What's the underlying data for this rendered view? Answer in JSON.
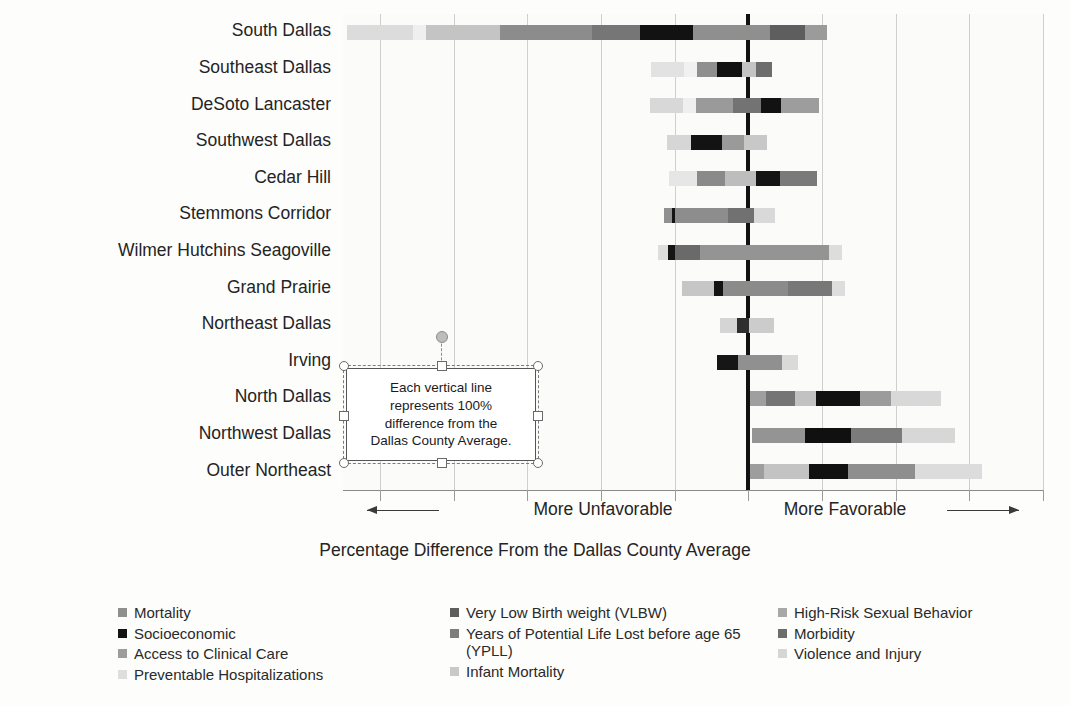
{
  "chart_data": {
    "type": "bar",
    "subtype": "diverging-stacked-horizontal",
    "title": "",
    "xlabel": "Percentage Difference From the Dallas County Average",
    "ylabel": "",
    "grid": true,
    "legend_position": "bottom",
    "axis": {
      "zero_label": "0",
      "gridline_step_percent": 100,
      "xlim": [
        -550,
        400
      ],
      "left_direction_label": "More Unfavorable",
      "right_direction_label": "More Favorable",
      "tick_positions": [
        -500,
        -400,
        -300,
        -200,
        -100,
        0,
        100,
        200,
        300,
        400
      ]
    },
    "categories": [
      "South Dallas",
      "Southeast Dallas",
      "DeSoto Lancaster",
      "Southwest Dallas",
      "Cedar Hill",
      "Stemmons Corridor",
      "Wilmer Hutchins Seagoville",
      "Grand Prairie",
      "Northeast Dallas",
      "Irving",
      "North Dallas",
      "Northwest Dallas",
      "Outer Northeast"
    ],
    "series": [
      {
        "name": "Mortality",
        "color": "#8f8f8f"
      },
      {
        "name": "Socioeconomic",
        "color": "#131313"
      },
      {
        "name": "Access to Clinical Care",
        "color": "#9d9d9d"
      },
      {
        "name": "Preventable Hospitalizations",
        "color": "#e0e0e0"
      },
      {
        "name": "Very Low Birth weight (VLBW)",
        "color": "#5e5e5e"
      },
      {
        "name": "Years of Potential Life Lost before age 65 (YPLL)",
        "color": "#7d7d7d"
      },
      {
        "name": "Infant Mortality",
        "color": "#c9c9c9"
      },
      {
        "name": "High-Risk Sexual Behavior",
        "color": "#a8a8a8"
      },
      {
        "name": "Morbidity",
        "color": "#6d6d6d"
      },
      {
        "name": "Violence and Injury",
        "color": "#d6d6d6"
      }
    ],
    "rows": [
      {
        "category": "South Dallas",
        "start_percent": -545,
        "segments": [
          {
            "name": "Preventable Hospitalizations",
            "width_percent": 90,
            "color": "#dcdcdc"
          },
          {
            "name": "Violence and Injury",
            "width_percent": 18,
            "color": "#efefef"
          },
          {
            "name": "Infant Mortality",
            "width_percent": 100,
            "color": "#c4c4c4"
          },
          {
            "name": "Years of Potential Life Lost before age 65 (YPLL)",
            "width_percent": 125,
            "color": "#8c8c8c"
          },
          {
            "name": "Morbidity",
            "width_percent": 65,
            "color": "#767676"
          },
          {
            "name": "Socioeconomic",
            "width_percent": 72,
            "color": "#121212"
          },
          {
            "name": "Mortality",
            "width_percent": 105,
            "color": "#8f8f8f"
          },
          {
            "name": "Very Low Birth weight (VLBW)",
            "width_percent": 47,
            "color": "#5e5e5e"
          },
          {
            "name": "Access to Clinical Care",
            "width_percent": 30,
            "color": "#9b9b9b"
          }
        ]
      },
      {
        "category": "Southeast Dallas",
        "start_percent": -132,
        "segments": [
          {
            "name": "Preventable Hospitalizations",
            "width_percent": 45,
            "color": "#e2e2e2"
          },
          {
            "name": "Violence and Injury",
            "width_percent": 17,
            "color": "#f1f1f1"
          },
          {
            "name": "Mortality",
            "width_percent": 27,
            "color": "#8f8f8f"
          },
          {
            "name": "Socioeconomic",
            "width_percent": 35,
            "color": "#121212"
          },
          {
            "name": "Infant Mortality",
            "width_percent": 18,
            "color": "#c4c4c4"
          },
          {
            "name": "Morbidity",
            "width_percent": 22,
            "color": "#6d6d6d"
          }
        ]
      },
      {
        "category": "DeSoto Lancaster",
        "start_percent": -133,
        "segments": [
          {
            "name": "Preventable Hospitalizations",
            "width_percent": 44,
            "color": "#d8d8d8"
          },
          {
            "name": "Violence and Injury",
            "width_percent": 18,
            "color": "#efefef"
          },
          {
            "name": "Years of Potential Life Lost before age 65 (YPLL)",
            "width_percent": 50,
            "color": "#9a9a9a"
          },
          {
            "name": "Morbidity",
            "width_percent": 38,
            "color": "#737373"
          },
          {
            "name": "Socioeconomic",
            "width_percent": 27,
            "color": "#121212"
          },
          {
            "name": "Access to Clinical Care",
            "width_percent": 52,
            "color": "#9d9d9d"
          }
        ]
      },
      {
        "category": "Southwest Dallas",
        "start_percent": -110,
        "segments": [
          {
            "name": "Preventable Hospitalizations",
            "width_percent": 32,
            "color": "#d6d6d6"
          },
          {
            "name": "Socioeconomic",
            "width_percent": 42,
            "color": "#131313"
          },
          {
            "name": "Mortality",
            "width_percent": 30,
            "color": "#9a9a9a"
          },
          {
            "name": "Infant Mortality",
            "width_percent": 32,
            "color": "#c8c8c8"
          }
        ]
      },
      {
        "category": "Cedar Hill",
        "start_percent": -108,
        "segments": [
          {
            "name": "Violence and Injury",
            "width_percent": 38,
            "color": "#e6e6e6"
          },
          {
            "name": "Years of Potential Life Lost before age 65 (YPLL)",
            "width_percent": 38,
            "color": "#8a8a8a"
          },
          {
            "name": "Infant Mortality",
            "width_percent": 42,
            "color": "#bdbdbd"
          },
          {
            "name": "Socioeconomic",
            "width_percent": 33,
            "color": "#141414"
          },
          {
            "name": "Morbidity",
            "width_percent": 50,
            "color": "#7a7a7a"
          }
        ]
      },
      {
        "category": "Stemmons Corridor",
        "start_percent": -114,
        "segments": [
          {
            "name": "Access to Clinical Care",
            "width_percent": 10,
            "color": "#909090"
          },
          {
            "name": "Socioeconomic",
            "width_percent": 5,
            "color": "#141414"
          },
          {
            "name": "Years of Potential Life Lost before age 65 (YPLL)",
            "width_percent": 72,
            "color": "#8d8d8d"
          },
          {
            "name": "Morbidity",
            "width_percent": 35,
            "color": "#717171"
          },
          {
            "name": "Preventable Hospitalizations",
            "width_percent": 28,
            "color": "#d9d9d9"
          }
        ]
      },
      {
        "category": "Wilmer Hutchins Seagoville",
        "start_percent": -122,
        "segments": [
          {
            "name": "Preventable Hospitalizations",
            "width_percent": 13,
            "color": "#dedede"
          },
          {
            "name": "Socioeconomic",
            "width_percent": 9,
            "color": "#151515"
          },
          {
            "name": "Morbidity",
            "width_percent": 34,
            "color": "#6a6a6a"
          },
          {
            "name": "Mortality",
            "width_percent": 175,
            "color": "#949494"
          },
          {
            "name": "Violence and Injury",
            "width_percent": 18,
            "color": "#dddddd"
          }
        ]
      },
      {
        "category": "Grand Prairie",
        "start_percent": -90,
        "segments": [
          {
            "name": "Infant Mortality",
            "width_percent": 44,
            "color": "#c6c6c6"
          },
          {
            "name": "Socioeconomic",
            "width_percent": 12,
            "color": "#131313"
          },
          {
            "name": "Years of Potential Life Lost before age 65 (YPLL)",
            "width_percent": 88,
            "color": "#8b8b8b"
          },
          {
            "name": "Morbidity",
            "width_percent": 60,
            "color": "#787878"
          },
          {
            "name": "Violence and Injury",
            "width_percent": 18,
            "color": "#dddddd"
          }
        ]
      },
      {
        "category": "Northeast Dallas",
        "start_percent": -38,
        "segments": [
          {
            "name": "Preventable Hospitalizations",
            "width_percent": 23,
            "color": "#d5d5d5"
          },
          {
            "name": "Socioeconomic",
            "width_percent": 16,
            "color": "#2e2e2e"
          },
          {
            "name": "Infant Mortality",
            "width_percent": 34,
            "color": "#cccccc"
          }
        ]
      },
      {
        "category": "Irving",
        "start_percent": -42,
        "segments": [
          {
            "name": "Socioeconomic",
            "width_percent": 28,
            "color": "#161616"
          },
          {
            "name": "Mortality",
            "width_percent": 60,
            "color": "#909090"
          },
          {
            "name": "Violence and Injury",
            "width_percent": 22,
            "color": "#dadada"
          }
        ]
      },
      {
        "category": "North Dallas",
        "start_percent": 2,
        "segments": [
          {
            "name": "Access to Clinical Care",
            "width_percent": 22,
            "color": "#9f9f9f"
          },
          {
            "name": "Morbidity",
            "width_percent": 40,
            "color": "#757575"
          },
          {
            "name": "Infant Mortality",
            "width_percent": 28,
            "color": "#c2c2c2"
          },
          {
            "name": "Socioeconomic",
            "width_percent": 60,
            "color": "#111111"
          },
          {
            "name": "Mortality",
            "width_percent": 42,
            "color": "#9b9b9b"
          },
          {
            "name": "Preventable Hospitalizations",
            "width_percent": 68,
            "color": "#d8d8d8"
          }
        ]
      },
      {
        "category": "Northwest Dallas",
        "start_percent": 5,
        "segments": [
          {
            "name": "Mortality",
            "width_percent": 72,
            "color": "#949494"
          },
          {
            "name": "Socioeconomic",
            "width_percent": 62,
            "color": "#101010"
          },
          {
            "name": "Morbidity",
            "width_percent": 70,
            "color": "#7b7b7b"
          },
          {
            "name": "Violence and Injury",
            "width_percent": 72,
            "color": "#d7d7d7"
          }
        ]
      },
      {
        "category": "Outer Northeast",
        "start_percent": 3,
        "segments": [
          {
            "name": "Access to Clinical Care",
            "width_percent": 18,
            "color": "#9d9d9d"
          },
          {
            "name": "Infant Mortality",
            "width_percent": 62,
            "color": "#c3c3c3"
          },
          {
            "name": "Socioeconomic",
            "width_percent": 52,
            "color": "#111111"
          },
          {
            "name": "Years of Potential Life Lost before age 65 (YPLL)",
            "width_percent": 92,
            "color": "#8e8e8e"
          },
          {
            "name": "Violence and Injury",
            "width_percent": 90,
            "color": "#dcdcdc"
          }
        ]
      }
    ],
    "annotation": {
      "text": "Each vertical line represents 100% difference from the Dallas County Average.",
      "line1": "Each vertical line",
      "line2": "represents 100%",
      "line3": "difference from the",
      "line4": "Dallas County Average."
    }
  },
  "legend": {
    "columns": [
      [
        {
          "label": "Mortality",
          "color": "#8f8f8f"
        },
        {
          "label": "Socioeconomic",
          "color": "#131313"
        },
        {
          "label": "Access to Clinical Care",
          "color": "#9d9d9d"
        },
        {
          "label": "Preventable Hospitalizations",
          "color": "#dedede"
        }
      ],
      [
        {
          "label": "Very Low Birth weight (VLBW)",
          "color": "#5e5e5e"
        },
        {
          "label": "Years of Potential Life Lost before age 65 (YPLL)",
          "color": "#7d7d7d"
        },
        {
          "label": "Infant Mortality",
          "color": "#c9c9c9"
        }
      ],
      [
        {
          "label": "High-Risk Sexual Behavior",
          "color": "#a8a8a8"
        },
        {
          "label": "Morbidity",
          "color": "#6d6d6d"
        },
        {
          "label": "Violence and Injury",
          "color": "#d6d6d6"
        }
      ]
    ]
  },
  "selection": {
    "is_selected": true,
    "handle_count": 8,
    "rotate_handle": "rotate-handle"
  }
}
